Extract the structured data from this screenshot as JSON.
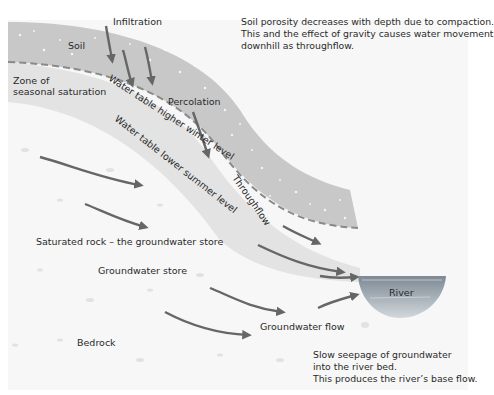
{
  "diagram": {
    "colors": {
      "soil_band": "#c9c9c9",
      "saturation_zone": "#e4e4e4",
      "bedrock": "#f7f7f7",
      "arrow": "#666666",
      "dashed_line": "#8a8a8a",
      "river_top": "#7f8c97",
      "river_bottom": "#c4ccd2"
    },
    "labels": {
      "infiltration": "Infiltration",
      "soil": "Soil",
      "zone_line1": "Zone of",
      "zone_line2": "seasonal saturation",
      "percolation": "Percolation",
      "water_table_winter": "Water table higher winter level",
      "water_table_summer": "Water table lower summer level",
      "throughflow": "Throughflow",
      "saturated_rock": "Saturated rock – the groundwater store",
      "groundwater_store": "Groundwater store",
      "groundwater_flow": "Groundwater flow",
      "bedrock": "Bedrock",
      "river": "River"
    },
    "notes": {
      "porosity": {
        "line1": "Soil porosity decreases with depth due to compaction.",
        "line2": "This and the effect of gravity causes water movement",
        "line3": "downhill as throughflow."
      },
      "seepage": {
        "line1": "Slow seepage of groundwater",
        "line2": "into the river bed.",
        "line3": "This produces the river’s base flow."
      }
    }
  }
}
